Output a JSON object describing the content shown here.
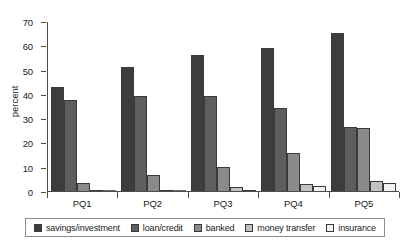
{
  "chart_data": {
    "type": "bar",
    "title": "",
    "xlabel": "",
    "ylabel": "percent",
    "ylim": [
      0,
      70
    ],
    "yticks": [
      0,
      10,
      20,
      30,
      40,
      50,
      60,
      70
    ],
    "grid": false,
    "legend_position": "bottom",
    "categories": [
      "PQ1",
      "PQ2",
      "PQ3",
      "PQ4",
      "PQ5"
    ],
    "series": [
      {
        "name": "savings/investment",
        "color": "#3d3d3d",
        "values": [
          43,
          51,
          56,
          59,
          65
        ]
      },
      {
        "name": "loan/credit",
        "color": "#5e5e5e",
        "values": [
          37.5,
          39,
          39,
          34,
          26.5
        ]
      },
      {
        "name": "banked",
        "color": "#8a8a8a",
        "values": [
          3.5,
          6.5,
          10,
          15.5,
          26
        ]
      },
      {
        "name": "money transfer",
        "color": "#c2c2c2",
        "values": [
          0.5,
          0.5,
          1.5,
          3,
          4
        ]
      },
      {
        "name": "insurance",
        "color": "#f2f2f2",
        "values": [
          0,
          0,
          0.5,
          2,
          3.5
        ]
      }
    ]
  },
  "axes": {
    "y_label": "percent",
    "y_tick_labels": [
      "0",
      "10",
      "20",
      "30",
      "40",
      "50",
      "60",
      "70"
    ],
    "x_tick_labels": [
      "PQ1",
      "PQ2",
      "PQ3",
      "PQ4",
      "PQ5"
    ]
  },
  "legend": {
    "items": [
      {
        "label": "savings/investment",
        "color": "#3d3d3d"
      },
      {
        "label": "loan/credit",
        "color": "#5e5e5e"
      },
      {
        "label": "banked",
        "color": "#8a8a8a"
      },
      {
        "label": "money transfer",
        "color": "#c2c2c2"
      },
      {
        "label": "insurance",
        "color": "#f2f2f2"
      }
    ]
  }
}
